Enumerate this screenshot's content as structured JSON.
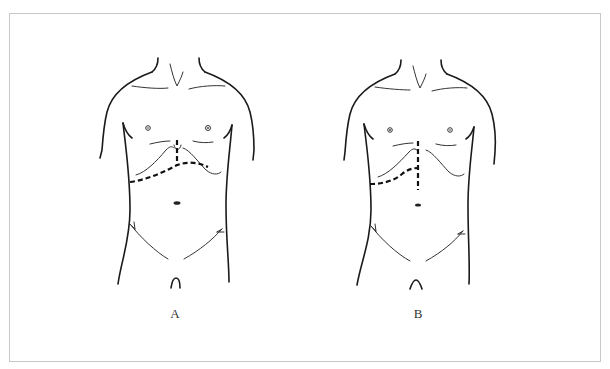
{
  "figure": {
    "panels": [
      {
        "id": "A",
        "label": "A",
        "description": "Torso outline with subcostal incision and short midline xiphoid incision",
        "incision_type": "bilateral subcostal (chevron) with short vertical midline extension"
      },
      {
        "id": "B",
        "label": "B",
        "description": "Torso outline with upper midline incision and right subcostal extension",
        "incision_type": "upper midline with right subcostal extension"
      }
    ],
    "colors": {
      "line": "#1a1a1a",
      "frame": "#c8c8c8",
      "background": "#ffffff"
    }
  }
}
